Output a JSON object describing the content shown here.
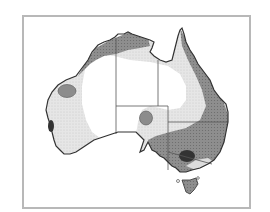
{
  "map": {
    "subject": "Australia",
    "type": "shaded zone map (grayscale)",
    "frame": {
      "border_color": "#b8b8b8",
      "background": "#ffffff"
    },
    "colors": {
      "outline": "#333333",
      "interior_unshaded": "#ffffff",
      "zone_light": "#e4e4e4",
      "zone_medium": "#9a9a9a",
      "zone_dark": "#6e6e6e",
      "spot_medium": "#8c8c8c",
      "spot_dark": "#3a3a3a",
      "state_border": "#555555"
    },
    "regions": [
      {
        "name": "light-zone",
        "description": "light stippled band around interior"
      },
      {
        "name": "dark-coastal-zone",
        "description": "darker shading along north, east and south-east coasts"
      },
      {
        "name": "western-spot",
        "description": "medium gray oval in Western Australia"
      },
      {
        "name": "southwest-spot",
        "description": "dark patch on south-west coast"
      },
      {
        "name": "sa-spot",
        "description": "medium gray circle in north-east South Australia"
      },
      {
        "name": "victoria-nsw-spot",
        "description": "dark oval near NSW/Victoria border"
      }
    ]
  }
}
